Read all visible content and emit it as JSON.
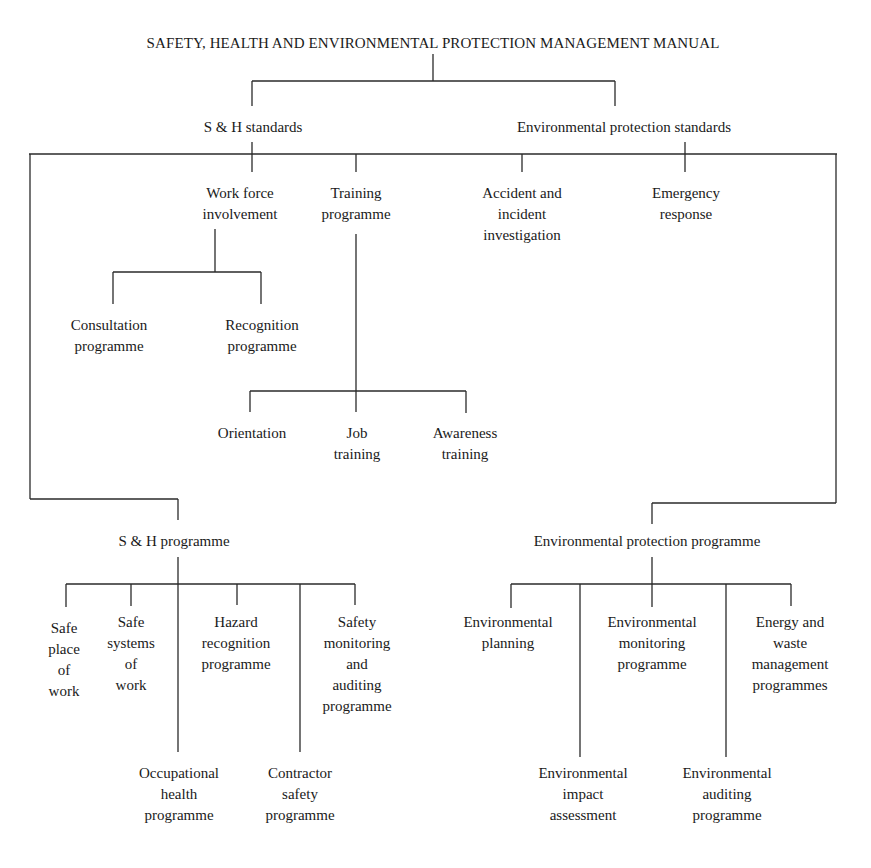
{
  "diagram": {
    "title": "SAFETY, HEALTH AND ENVIRONMENTAL PROTECTION MANAGEMENT MANUAL",
    "level1": {
      "sh_standards": "S & H standards",
      "env_standards": "Environmental protection standards"
    },
    "level2": {
      "work_force": [
        "Work force",
        "involvement"
      ],
      "training": [
        "Training",
        "programme"
      ],
      "accident": [
        "Accident and",
        "incident",
        "investigation"
      ],
      "emergency": [
        "Emergency",
        "response"
      ]
    },
    "work_force_children": {
      "consultation": [
        "Consultation",
        "programme"
      ],
      "recognition": [
        "Recognition",
        "programme"
      ]
    },
    "training_children": {
      "orientation": [
        "Orientation"
      ],
      "job_training": [
        "Job",
        "training"
      ],
      "awareness": [
        "Awareness",
        "training"
      ]
    },
    "programmes": {
      "sh_programme": "S & H programme",
      "env_programme": "Environmental protection programme"
    },
    "sh_programme_children": {
      "safe_place": [
        "Safe",
        "place",
        "of",
        "work"
      ],
      "safe_systems": [
        "Safe",
        "systems",
        "of",
        "work"
      ],
      "hazard": [
        "Hazard",
        "recognition",
        "programme"
      ],
      "safety_monitoring": [
        "Safety",
        "monitoring",
        "and",
        "auditing",
        "programme"
      ],
      "occupational": [
        "Occupational",
        "health",
        "programme"
      ],
      "contractor": [
        "Contractor",
        "safety",
        "programme"
      ]
    },
    "env_programme_children": {
      "planning": [
        "Environmental",
        "planning"
      ],
      "monitoring": [
        "Environmental",
        "monitoring",
        "programme"
      ],
      "energy_waste": [
        "Energy and",
        "waste",
        "management",
        "programmes"
      ],
      "impact": [
        "Environmental",
        "impact",
        "assessment"
      ],
      "auditing": [
        "Environmental",
        "auditing",
        "programme"
      ]
    },
    "line_color": "#2a2a2a"
  }
}
